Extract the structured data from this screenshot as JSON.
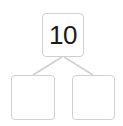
{
  "diagram": {
    "type": "number-bond",
    "whole": {
      "value": "10"
    },
    "parts": [
      {
        "value": ""
      },
      {
        "value": ""
      }
    ],
    "colors": {
      "border": "#d0d0d0",
      "line": "#cfcfcf",
      "text": "#1a1a1a"
    }
  }
}
